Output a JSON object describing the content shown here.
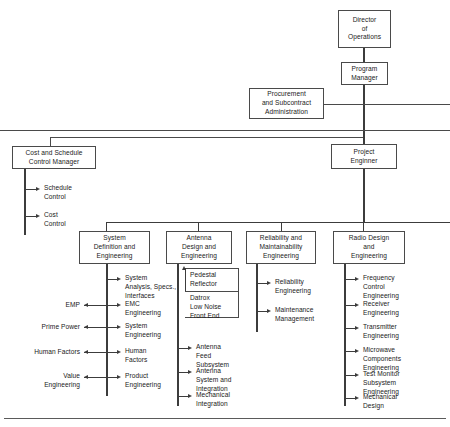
{
  "diagram": {
    "type": "organization-chart",
    "nodes": {
      "director": {
        "label": "Director\nof\nOperations"
      },
      "program_manager": {
        "label": "Program\nManager"
      },
      "procurement": {
        "label": "Procurement\nand Subcontract\nAdministration"
      },
      "project_engineer": {
        "label": "Project\nEnginner"
      },
      "cost_schedule": {
        "label": "Cost and Schedule\nControl Manager"
      },
      "system_definition": {
        "label": "System\nDefinition and\nEngineering"
      },
      "antenna_design": {
        "label": "Antenna\nDesign and\nEngineering"
      },
      "reliability": {
        "label": "Reliability and\nMaintainability\nEngineering"
      },
      "radio_design": {
        "label": "Radio Design\nand\nEngineering"
      }
    },
    "cost_schedule_items": [
      {
        "label": "Schedule\nControl"
      },
      {
        "label": "Cost\nControl"
      }
    ],
    "system_definition_items": [
      {
        "label": "System\nAnalysis, Specs.,\nInterfaces",
        "left_label": ""
      },
      {
        "label": "EMC\nEngineering",
        "left_label": "EMP"
      },
      {
        "label": "System\nEngineering",
        "left_label": "Prime Power"
      },
      {
        "label": "Human\nFactors",
        "left_label": "Human Factors"
      },
      {
        "label": "Product\nEngineering",
        "left_label": "Value\nEngineering"
      }
    ],
    "antenna_subgroup": [
      {
        "label": "Pedestal\nReflector"
      },
      {
        "label": "Datrox\nLow Noise\nFront End"
      }
    ],
    "antenna_items": [
      {
        "label": "Antenna\nFeed\nSubsystem"
      },
      {
        "label": "Antenna\nSystem and\nIntegration"
      },
      {
        "label": "Mechanical\nIntegration"
      }
    ],
    "reliability_items": [
      {
        "label": "Reliability\nEngineering"
      },
      {
        "label": "Maintenance\nManagement"
      }
    ],
    "radio_design_items": [
      {
        "label": "Frequency\nControl\nEngineering"
      },
      {
        "label": "Receiver\nEngineering"
      },
      {
        "label": "Transmitter\nEngineering"
      },
      {
        "label": "Microwave\nComponents\nEngineering"
      },
      {
        "label": "Test Monitor\nSubsystem\nEngineering"
      },
      {
        "label": "Mechanical\nDesign"
      }
    ],
    "colors": {
      "line": "#4a4a4a",
      "text": "#1a1a1a",
      "background": "#ffffff"
    }
  }
}
